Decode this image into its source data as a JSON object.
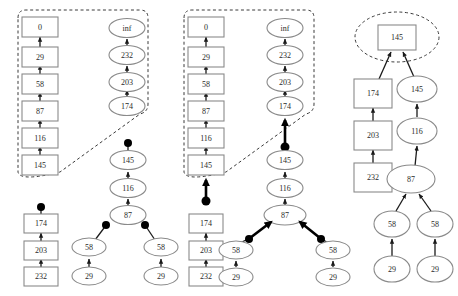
{
  "figure": {
    "type": "graph-diagram",
    "title": "",
    "background_color": "#ffffff",
    "node_stroke_color": "#8a8a8a",
    "label_color": "#2a2a2a",
    "highlight_color": "#000000",
    "dashed_region_color": "#3a3a3a"
  },
  "panels": [
    {
      "id": "panel-left",
      "name": "left-panel",
      "dashed_regions": [
        {
          "id": "region-left",
          "shape": "rounded-path"
        }
      ],
      "chains": [
        {
          "id": "left-boxes",
          "shape": "box",
          "orientation": "bottom-to-top",
          "labels": [
            "145",
            "116",
            "87",
            "58",
            "29",
            "0"
          ]
        },
        {
          "id": "left-ellipses-top",
          "shape": "ellipse",
          "orientation": "bottom-to-top",
          "labels": [
            "174",
            "203",
            "232",
            "inf"
          ]
        },
        {
          "id": "left-ellipses-mid",
          "shape": "ellipse",
          "orientation": "bottom-to-top",
          "labels": [
            "87",
            "116",
            "145"
          ],
          "has_root_dot": true
        },
        {
          "id": "left-boxes-lower",
          "shape": "box",
          "orientation": "bottom-to-top",
          "labels": [
            "232",
            "203",
            "174"
          ],
          "has_root_dot": true
        },
        {
          "id": "left-pair-a",
          "shape": "ellipse",
          "orientation": "bottom-to-top",
          "labels": [
            "29",
            "58"
          ],
          "has_root_dot": true,
          "dot_side": "right"
        },
        {
          "id": "left-pair-b",
          "shape": "ellipse",
          "orientation": "bottom-to-top",
          "labels": [
            "29",
            "58"
          ],
          "has_root_dot": true,
          "dot_side": "left"
        }
      ]
    },
    {
      "id": "panel-middle",
      "name": "middle-panel",
      "dashed_regions": [
        {
          "id": "region-middle",
          "shape": "rounded-path"
        }
      ],
      "chains": [
        {
          "id": "mid-boxes",
          "shape": "box",
          "orientation": "bottom-to-top",
          "labels": [
            "145",
            "116",
            "87",
            "58",
            "29",
            "0"
          ]
        },
        {
          "id": "mid-ellipses-top",
          "shape": "ellipse",
          "orientation": "bottom-to-top",
          "labels": [
            "174",
            "203",
            "232",
            "inf"
          ]
        },
        {
          "id": "mid-boxes-lower",
          "shape": "box",
          "orientation": "bottom-to-top",
          "labels": [
            "232",
            "203",
            "174"
          ],
          "has_root_dot": true
        },
        {
          "id": "mid-ellipses-stack",
          "shape": "ellipse",
          "orientation": "bottom-to-top",
          "labels": [
            "87",
            "116",
            "145"
          ],
          "has_root_dot": true
        },
        {
          "id": "mid-merge-left",
          "shape": "ellipse",
          "orientation": "bottom-to-top",
          "labels": [
            "29",
            "58"
          ],
          "merges_into": "87"
        },
        {
          "id": "mid-merge-right",
          "shape": "ellipse",
          "orientation": "bottom-to-top",
          "labels": [
            "29",
            "58"
          ],
          "merges_into": "87"
        }
      ]
    },
    {
      "id": "panel-right",
      "name": "right-panel",
      "dashed_regions": [
        {
          "id": "region-right",
          "shape": "ellipse"
        }
      ],
      "chains": [
        {
          "id": "right-root",
          "shape": "box",
          "labels": [
            "145"
          ],
          "inside_dashed": true
        },
        {
          "id": "right-boxes",
          "shape": "box",
          "orientation": "bottom-to-top",
          "labels": [
            "232",
            "203",
            "174"
          ]
        },
        {
          "id": "right-ellipses",
          "shape": "ellipse",
          "orientation": "bottom-to-top",
          "labels": [
            "87",
            "116",
            "145"
          ]
        },
        {
          "id": "right-merge-left",
          "shape": "ellipse",
          "orientation": "bottom-to-top",
          "labels": [
            "29",
            "58"
          ],
          "merges_into": "87"
        },
        {
          "id": "right-merge-right",
          "shape": "ellipse",
          "orientation": "bottom-to-top",
          "labels": [
            "29",
            "58"
          ],
          "merges_into": "87"
        }
      ]
    }
  ],
  "nodes": {
    "L_b0": {
      "label": "0",
      "shape": "box",
      "x": 40,
      "y": 27
    },
    "L_b29": {
      "label": "29",
      "shape": "box",
      "x": 40,
      "y": 57
    },
    "L_b58": {
      "label": "58",
      "shape": "box",
      "x": 40,
      "y": 84
    },
    "L_b87": {
      "label": "87",
      "shape": "box",
      "x": 40,
      "y": 111
    },
    "L_b116": {
      "label": "116",
      "shape": "box",
      "x": 40,
      "y": 138
    },
    "L_b145": {
      "label": "145",
      "shape": "box",
      "x": 40,
      "y": 165
    },
    "L_einf": {
      "label": "inf",
      "shape": "ellipse",
      "x": 127,
      "y": 27
    },
    "L_e232": {
      "label": "232",
      "shape": "ellipse",
      "x": 127,
      "y": 55
    },
    "L_e203": {
      "label": "203",
      "shape": "ellipse",
      "x": 127,
      "y": 82
    },
    "L_e174": {
      "label": "174",
      "shape": "ellipse",
      "x": 127,
      "y": 106
    },
    "L_m145": {
      "label": "145",
      "shape": "ellipse",
      "x": 128,
      "y": 160
    },
    "L_m116": {
      "label": "116",
      "shape": "ellipse",
      "x": 128,
      "y": 188
    },
    "L_m87": {
      "label": "87",
      "shape": "ellipse",
      "x": 128,
      "y": 215
    },
    "L_l174": {
      "label": "174",
      "shape": "box",
      "x": 41,
      "y": 224
    },
    "L_l203": {
      "label": "203",
      "shape": "box",
      "x": 41,
      "y": 251
    },
    "L_l232": {
      "label": "232",
      "shape": "box",
      "x": 41,
      "y": 277
    },
    "L_p1_58": {
      "label": "58",
      "shape": "ellipse",
      "x": 89,
      "y": 247
    },
    "L_p1_29": {
      "label": "29",
      "shape": "ellipse",
      "x": 89,
      "y": 276
    },
    "L_p2_58": {
      "label": "58",
      "shape": "ellipse",
      "x": 161,
      "y": 247
    },
    "L_p2_29": {
      "label": "29",
      "shape": "ellipse",
      "x": 161,
      "y": 276
    },
    "M_b0": {
      "label": "0",
      "shape": "box",
      "x": 206,
      "y": 27
    },
    "M_b29": {
      "label": "29",
      "shape": "box",
      "x": 206,
      "y": 57
    },
    "M_b58": {
      "label": "58",
      "shape": "box",
      "x": 206,
      "y": 84
    },
    "M_b87": {
      "label": "87",
      "shape": "box",
      "x": 206,
      "y": 111
    },
    "M_b116": {
      "label": "116",
      "shape": "box",
      "x": 206,
      "y": 138
    },
    "M_b145": {
      "label": "145",
      "shape": "box",
      "x": 206,
      "y": 165
    },
    "M_einf": {
      "label": "inf",
      "shape": "ellipse",
      "x": 285,
      "y": 27
    },
    "M_e232": {
      "label": "232",
      "shape": "ellipse",
      "x": 285,
      "y": 55
    },
    "M_e203": {
      "label": "203",
      "shape": "ellipse",
      "x": 285,
      "y": 82
    },
    "M_e174": {
      "label": "174",
      "shape": "ellipse",
      "x": 285,
      "y": 106
    },
    "M_l174": {
      "label": "174",
      "shape": "box",
      "x": 206,
      "y": 224
    },
    "M_l203": {
      "label": "203",
      "shape": "box",
      "x": 206,
      "y": 251
    },
    "M_l232": {
      "label": "232",
      "shape": "box",
      "x": 206,
      "y": 277
    },
    "M_s145": {
      "label": "145",
      "shape": "ellipse",
      "x": 285,
      "y": 160
    },
    "M_s116": {
      "label": "116",
      "shape": "ellipse",
      "x": 285,
      "y": 188
    },
    "M_s87": {
      "label": "87",
      "shape": "ellipse",
      "x": 285,
      "y": 215
    },
    "M_ml58": {
      "label": "58",
      "shape": "ellipse",
      "x": 236,
      "y": 250
    },
    "M_ml29": {
      "label": "29",
      "shape": "ellipse",
      "x": 236,
      "y": 277
    },
    "M_mr58": {
      "label": "58",
      "shape": "ellipse",
      "x": 333,
      "y": 250
    },
    "M_mr29": {
      "label": "29",
      "shape": "ellipse",
      "x": 333,
      "y": 277
    },
    "R_root": {
      "label": "145",
      "shape": "box",
      "x": 397,
      "y": 37
    },
    "R_b174": {
      "label": "174",
      "shape": "box",
      "x": 373,
      "y": 93
    },
    "R_b203": {
      "label": "203",
      "shape": "box",
      "x": 373,
      "y": 135
    },
    "R_b232": {
      "label": "232",
      "shape": "box",
      "x": 373,
      "y": 177
    },
    "R_e145": {
      "label": "145",
      "shape": "ellipse",
      "x": 417,
      "y": 89
    },
    "R_e116": {
      "label": "116",
      "shape": "ellipse",
      "x": 417,
      "y": 131
    },
    "R_e87": {
      "label": "87",
      "shape": "ellipse",
      "x": 411,
      "y": 179
    },
    "R_l58": {
      "label": "58",
      "shape": "ellipse",
      "x": 392,
      "y": 224
    },
    "R_l29": {
      "label": "29",
      "shape": "ellipse",
      "x": 392,
      "y": 269
    },
    "R_r58": {
      "label": "58",
      "shape": "ellipse",
      "x": 435,
      "y": 224
    },
    "R_r29": {
      "label": "29",
      "shape": "ellipse",
      "x": 435,
      "y": 269
    }
  }
}
